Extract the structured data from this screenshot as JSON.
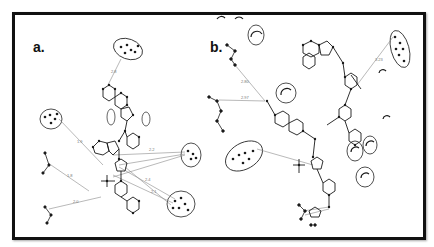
{
  "figure": {
    "frame_color": "#111111",
    "bond_color": "#1a1a1a",
    "hbond_color": "#8a8a8a",
    "panels": [
      {
        "id": "a",
        "label": "a.",
        "distances": [
          "2.8",
          "1.9",
          "1.8",
          "2.0",
          "2.2",
          "2.4",
          "2.1"
        ],
        "interacting_residues_circled": 4,
        "residue_labels_legible": false
      },
      {
        "id": "b",
        "label": "b.",
        "distances": [
          "2.80",
          "2.97",
          "3.23"
        ],
        "interacting_residues_circled": 6,
        "hydrophobic_contacts_arcs": 7,
        "residue_labels_legible": false
      }
    ]
  }
}
